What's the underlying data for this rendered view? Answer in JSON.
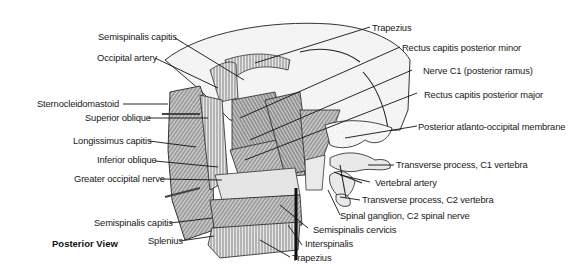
{
  "figure": {
    "view_label": "Posterior View",
    "labels_left": [
      {
        "id": "semispinalis-capitis-top",
        "text": "Semispinalis capitis"
      },
      {
        "id": "occipital-artery",
        "text": "Occipital artery"
      },
      {
        "id": "sternocleidomastoid",
        "text": "Sternocleidomastoid"
      },
      {
        "id": "superior-oblique",
        "text": "Superior oblique"
      },
      {
        "id": "longissimus-capitis",
        "text": "Longissimus capitis"
      },
      {
        "id": "inferior-oblique",
        "text": "Inferior oblique"
      },
      {
        "id": "greater-occipital-nerve",
        "text": "Greater occipital nerve"
      },
      {
        "id": "semispinalis-capitis-bottom",
        "text": "Semispinalis capitis"
      },
      {
        "id": "splenius",
        "text": "Splenius"
      }
    ],
    "labels_right": [
      {
        "id": "trapezius-top",
        "text": "Trapezius"
      },
      {
        "id": "rectus-capitis-posterior-minor",
        "text": "Rectus capitis posterior minor"
      },
      {
        "id": "nerve-c1",
        "text": "Nerve C1 (posterior ramus)"
      },
      {
        "id": "rectus-capitis-posterior-major",
        "text": "Rectus capitis posterior major"
      },
      {
        "id": "posterior-atlanto-occipital-membrane",
        "text": "Posterior atlanto-occipital membrane"
      },
      {
        "id": "transverse-process-c1",
        "text": "Transverse process, C1 vertebra"
      },
      {
        "id": "vertebral-artery",
        "text": "Vertebral artery"
      },
      {
        "id": "transverse-process-c2",
        "text": "Transverse process, C2 vertebra"
      },
      {
        "id": "spinal-ganglion-c2",
        "text": "Spinal ganglion, C2 spinal nerve"
      },
      {
        "id": "semispinalis-cervicis",
        "text": "Semispinalis cervicis"
      },
      {
        "id": "interspinalis",
        "text": "Interspinalis"
      },
      {
        "id": "trapezius-bottom",
        "text": "Trapezius"
      }
    ]
  }
}
